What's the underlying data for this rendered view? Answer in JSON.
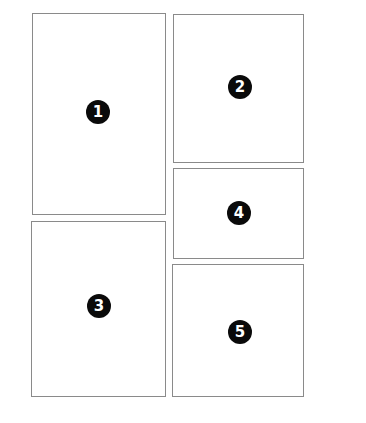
{
  "diagram": {
    "type": "page-layout-panels",
    "panels": [
      {
        "id": 1,
        "label": "1",
        "x": 32,
        "y": 13,
        "w": 134,
        "h": 202,
        "badge_x": 65,
        "badge_y": 98
      },
      {
        "id": 2,
        "label": "2",
        "x": 173,
        "y": 14,
        "w": 131,
        "h": 149,
        "badge_x": 66,
        "badge_y": 72
      },
      {
        "id": 3,
        "label": "3",
        "x": 31,
        "y": 221,
        "w": 135,
        "h": 176,
        "badge_x": 67,
        "badge_y": 84
      },
      {
        "id": 4,
        "label": "4",
        "x": 173,
        "y": 168,
        "w": 131,
        "h": 91,
        "badge_x": 65,
        "badge_y": 44
      },
      {
        "id": 5,
        "label": "5",
        "x": 172,
        "y": 264,
        "w": 132,
        "h": 133,
        "badge_x": 67,
        "badge_y": 67
      }
    ],
    "colors": {
      "border": "#8a8a8a",
      "badge_fill": "#0a0a0a",
      "badge_text": "#ffffff",
      "background": "#ffffff"
    }
  }
}
